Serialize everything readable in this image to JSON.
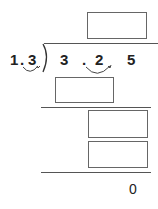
{
  "problem": {
    "divisor": {
      "d1": "1",
      "dot": ".",
      "d2": "3"
    },
    "dividend": {
      "d1": "3",
      "dot": ".",
      "d2": "2",
      "d3": "5"
    },
    "remainder": "0",
    "answer_boxes": 4
  },
  "colors": {
    "ink": "#222222",
    "box_border": "#666666",
    "line": "#555555"
  }
}
